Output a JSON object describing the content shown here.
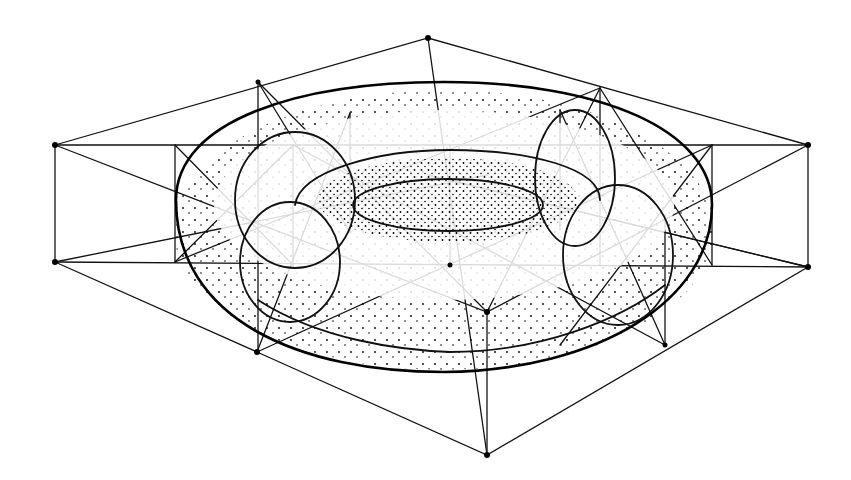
{
  "figure": {
    "style": "hand-drawn pen illustration with stipple shading",
    "colors": {
      "ink": "#000000",
      "background": "#ffffff"
    },
    "box": {
      "top_vertices": [
        [
          428,
          38
        ],
        [
          55,
          145
        ],
        [
          808,
          145
        ],
        [
          487,
          312
        ]
      ],
      "bottom_vertices": [
        [
          55,
          262
        ],
        [
          808,
          267
        ],
        [
          487,
          455
        ],
        [
          257,
          352
        ]
      ]
    }
  }
}
